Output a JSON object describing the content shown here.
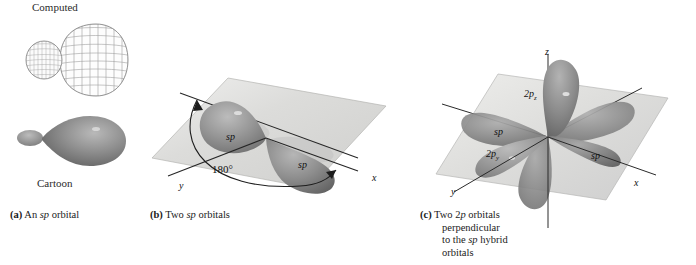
{
  "figure": {
    "background": "#ffffff",
    "ink": "#1a1a1a",
    "plane_fill": "#d8d8d6",
    "lobe_dark": "#6f6f6f",
    "lobe_mid": "#9a9a9a",
    "lobe_light": "#c9c9c9",
    "mesh_line": "#9b9b9b"
  },
  "panel_a": {
    "computed_label": "Computed",
    "cartoon_label": "Cartoon",
    "caption_tag": "(a)",
    "caption_text_1": "An ",
    "caption_italic": "sp",
    "caption_text_2": " orbital",
    "computed_orbital_name": "sp-orbital-wireframe",
    "cartoon_orbital_name": "sp-orbital-cartoon"
  },
  "panel_b": {
    "caption_tag": "(b)",
    "caption_text_1": "Two ",
    "caption_italic": "sp",
    "caption_text_2": " orbitals",
    "angle_label": "180°",
    "lobe_label_left": "sp",
    "lobe_label_right": "sp",
    "axis_x": "x",
    "axis_y": "y"
  },
  "panel_c": {
    "caption_tag": "(c)",
    "caption_line_1_a": "Two 2",
    "caption_line_1_it": "p",
    "caption_line_1_b": " orbitals",
    "caption_line_2": "perpendicular",
    "caption_line_3_a": "to the ",
    "caption_line_3_it": "sp",
    "caption_line_3_b": " hybrid",
    "caption_line_4": "orbitals",
    "label_2pz_main": "2p",
    "label_2pz_sub": "z",
    "label_2py_main": "2p",
    "label_2py_sub": "y",
    "lobe_label_left": "sp",
    "lobe_label_right": "sp",
    "axis_x": "x",
    "axis_y": "y",
    "axis_z": "z"
  }
}
